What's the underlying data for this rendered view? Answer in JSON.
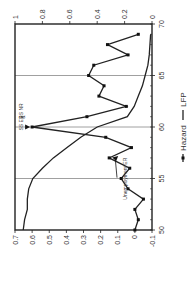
{
  "chart_data": {
    "type": "line",
    "orientation": "rotated-90-ccw",
    "title": "",
    "xlabel": "",
    "x": [
      50,
      51,
      52,
      53,
      54,
      55,
      56,
      57,
      58,
      59,
      60,
      61,
      62,
      63,
      64,
      65,
      66,
      67,
      68,
      69
    ],
    "xlim": [
      50,
      70
    ],
    "x_ticks": [
      "50",
      "55",
      "60",
      "65",
      "70"
    ],
    "y_left": {
      "label": "Hazard",
      "lim": [
        -0.1,
        0.7
      ],
      "ticks": [
        "0.7",
        "0.6",
        "0.5",
        "0.4",
        "0.3",
        "0.2",
        "0.1",
        "0",
        "-0.1"
      ]
    },
    "y_right": {
      "label": "LFP",
      "lim": [
        0,
        1
      ],
      "ticks": [
        "1",
        "0.8",
        "0.6",
        "0.4",
        "0.2",
        "0"
      ]
    },
    "series": [
      {
        "name": "Hazard",
        "axis": "left",
        "marker": "square",
        "values": [
          0.0,
          -0.02,
          0.0,
          -0.05,
          0.04,
          0.08,
          0.03,
          0.15,
          0.02,
          0.17,
          0.6,
          0.28,
          0.05,
          0.21,
          0.18,
          0.27,
          0.24,
          0.04,
          0.16,
          -0.02
        ]
      },
      {
        "name": "LFP",
        "axis": "right",
        "marker": "none",
        "x": [
          50,
          51,
          52,
          53,
          54,
          55,
          56,
          57,
          58,
          59,
          60,
          61,
          62,
          63,
          64,
          65,
          66,
          67,
          68,
          69
        ],
        "values": [
          0.94,
          0.93,
          0.91,
          0.91,
          0.9,
          0.87,
          0.8,
          0.72,
          0.62,
          0.52,
          0.4,
          0.18,
          0.13,
          0.1,
          0.07,
          0.05,
          0.03,
          0.02,
          0.015,
          0.01
        ]
      }
    ],
    "vertical_lines": [
      55,
      60,
      65
    ],
    "annotations": [
      {
        "text": "SS ER & SS NR",
        "lines": [
          "SS ER",
          "&",
          "SS NR"
        ],
        "x": 60,
        "arrow_to": [
          60,
          0.6
        ]
      },
      {
        "text": "Unemployment ER",
        "x": 57,
        "arrow_to": [
          57,
          0.15
        ]
      }
    ],
    "legend": {
      "position": "bottom",
      "entries": [
        "Hazard",
        "LFP"
      ]
    },
    "grid": false
  },
  "labels": {
    "annotation_ss": [
      "SS ER",
      "&",
      "SS NR"
    ],
    "annotation_unemp": "Unemployment ER",
    "legend_hazard": "Hazard",
    "legend_lfp": "LFP"
  }
}
